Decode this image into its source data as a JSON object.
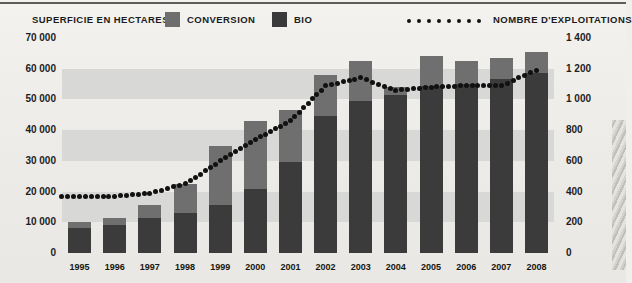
{
  "legend": {
    "left_title": "SUPERFICIE EN HECTARES",
    "conversion_label": "CONVERSION",
    "bio_label": "BIO",
    "line_label": "NOMBRE D'EXPLOITATIONS",
    "conversion_color": "#6f6f6f",
    "bio_color": "#3b3b3b",
    "line_color": "#111111"
  },
  "chart_data": {
    "type": "bar",
    "title": "SUPERFICIE EN HECTARES",
    "xlabel": "",
    "ylabel": "SUPERFICIE EN HECTARES",
    "y2label": "NOMBRE D'EXPLOITATIONS",
    "grid": true,
    "legend_position": "top",
    "categories": [
      "1995",
      "1996",
      "1997",
      "1998",
      "1999",
      "2000",
      "2001",
      "2002",
      "2003",
      "2004",
      "2005",
      "2006",
      "2007",
      "2008"
    ],
    "ylim": [
      0,
      70000
    ],
    "yticks": [
      0,
      10000,
      20000,
      30000,
      40000,
      50000,
      60000,
      70000
    ],
    "ytick_labels": [
      "0",
      "10 000",
      "20 000",
      "30 000",
      "40 000",
      "50 000",
      "60 000",
      "70 000"
    ],
    "y2lim": [
      0,
      1400
    ],
    "y2ticks": [
      0,
      200,
      400,
      600,
      800,
      1000,
      1200,
      1400
    ],
    "y2tick_labels": [
      "0",
      "200",
      "400",
      "600",
      "800",
      "1 000",
      "1 200",
      "1 400"
    ],
    "stacked": true,
    "series": [
      {
        "name": "BIO",
        "color": "#3b3b3b",
        "values": [
          8000,
          9000,
          11500,
          13000,
          15500,
          21000,
          29500,
          44500,
          49500,
          51500,
          54500,
          55000,
          56500,
          58500
        ]
      },
      {
        "name": "CONVERSION",
        "color": "#6f6f6f",
        "values": [
          2000,
          2500,
          4000,
          9500,
          19500,
          22000,
          17000,
          13500,
          13000,
          2500,
          9500,
          7500,
          7000,
          7000
        ]
      }
    ],
    "totals": [
      10000,
      11500,
      15500,
      22500,
      35000,
      43000,
      46500,
      58000,
      62500,
      54000,
      64000,
      62500,
      63500,
      65500
    ],
    "line_series": {
      "name": "NOMBRE D'EXPLOITATIONS",
      "color": "#111111",
      "style": "dotted",
      "axis": "right",
      "values": [
        370,
        370,
        390,
        450,
        600,
        740,
        860,
        1090,
        1140,
        1060,
        1080,
        1090,
        1090,
        1190
      ]
    }
  }
}
